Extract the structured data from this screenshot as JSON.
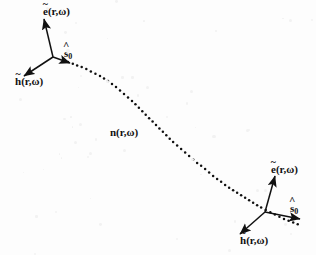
{
  "figure": {
    "width": 316,
    "height": 255,
    "background_color": "#fdfdfd",
    "ink_color": "#111111"
  },
  "labels": {
    "e_upper": {
      "base": "e",
      "accent": "~",
      "args": "(r,ω)"
    },
    "h_upper": {
      "base": "h",
      "accent": "~",
      "args": "(r,ω)"
    },
    "s_upper": {
      "base": "s",
      "accent": "^",
      "subscript": "0"
    },
    "e_lower": {
      "base": "e",
      "accent": "~",
      "args": "(r,ω)"
    },
    "h_lower": {
      "base": "h",
      "accent": "~",
      "args": "(r,ω)"
    },
    "s_lower": {
      "base": "s",
      "accent": "^",
      "subscript": "0"
    },
    "ray": {
      "text": "n(r,ω)"
    }
  },
  "chart_data": {
    "type": "line",
    "title": "",
    "xlabel": "",
    "ylabel": "",
    "xlim": [
      0,
      316
    ],
    "ylim": [
      255,
      0
    ],
    "grid": false,
    "legend": null,
    "series": [
      {
        "name": "ray-path",
        "style": "dotted",
        "marker": "dot",
        "points": [
          [
            68,
            62
          ],
          [
            76,
            65
          ],
          [
            84,
            68
          ],
          [
            92,
            72
          ],
          [
            100,
            76
          ],
          [
            108,
            81
          ],
          [
            116,
            87
          ],
          [
            124,
            94
          ],
          [
            132,
            101
          ],
          [
            140,
            109
          ],
          [
            148,
            117
          ],
          [
            156,
            125
          ],
          [
            164,
            133
          ],
          [
            172,
            141
          ],
          [
            180,
            148
          ],
          [
            188,
            155
          ],
          [
            196,
            162
          ],
          [
            204,
            168
          ],
          [
            212,
            175
          ],
          [
            220,
            181
          ],
          [
            228,
            187
          ],
          [
            236,
            192
          ],
          [
            244,
            197
          ],
          [
            252,
            202
          ],
          [
            260,
            207
          ],
          [
            268,
            211
          ],
          [
            276,
            215
          ],
          [
            284,
            219
          ],
          [
            292,
            222
          ],
          [
            300,
            225
          ]
        ]
      }
    ],
    "annotations": [
      {
        "name": "ray-label",
        "text": "n(r,ω)",
        "x": 120,
        "y": 132
      },
      {
        "name": "triad-origin-upper",
        "x": 53,
        "y": 57
      },
      {
        "name": "triad-origin-lower",
        "x": 265,
        "y": 212
      }
    ],
    "vectors": [
      {
        "name": "e-upper",
        "x1": 53,
        "y1": 57,
        "x2": 44,
        "y2": 19,
        "label": "e~(r,ω)"
      },
      {
        "name": "h-upper",
        "x1": 53,
        "y1": 57,
        "x2": 24,
        "y2": 76,
        "label": "h~(r,ω)"
      },
      {
        "name": "s-upper",
        "x1": 53,
        "y1": 57,
        "x2": 70,
        "y2": 63,
        "label": "s^0"
      },
      {
        "name": "e-lower",
        "x1": 265,
        "y1": 212,
        "x2": 275,
        "y2": 176,
        "label": "e~(r,ω)"
      },
      {
        "name": "h-lower",
        "x1": 265,
        "y1": 212,
        "x2": 240,
        "y2": 234,
        "label": "h~(r,ω)"
      },
      {
        "name": "s-lower",
        "x1": 265,
        "y1": 212,
        "x2": 300,
        "y2": 219,
        "label": "s^0"
      }
    ]
  }
}
